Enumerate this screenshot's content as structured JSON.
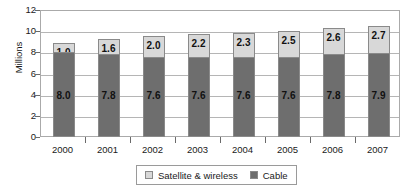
{
  "chart_data": {
    "type": "bar",
    "subtype": "stacked-bar",
    "title": "",
    "xlabel": "",
    "ylabel": "Millions",
    "ylim": [
      0,
      12
    ],
    "yticks": [
      0,
      2,
      4,
      6,
      8,
      10,
      12
    ],
    "grid": true,
    "legend_position": "bottom",
    "categories": [
      "2000",
      "2001",
      "2002",
      "2003",
      "2004",
      "2005",
      "2006",
      "2007"
    ],
    "series": [
      {
        "name": "Cable",
        "color": "#6e6e6e",
        "stack_order": 0,
        "values": [
          8.0,
          7.8,
          7.6,
          7.6,
          7.6,
          7.6,
          7.8,
          7.9
        ],
        "labels": [
          "8.0",
          "7.8",
          "7.6",
          "7.6",
          "7.6",
          "7.6",
          "7.8",
          "7.9"
        ]
      },
      {
        "name": "Satellite & wireless",
        "color": "#d8d8d8",
        "stack_order": 1,
        "values": [
          1.0,
          1.6,
          2.0,
          2.2,
          2.3,
          2.5,
          2.6,
          2.7
        ],
        "labels": [
          "1.0",
          "1.6",
          "2.0",
          "2.2",
          "2.3",
          "2.5",
          "2.6",
          "2.7"
        ]
      }
    ],
    "totals": [
      9.0,
      9.4,
      9.6,
      9.8,
      9.9,
      10.1,
      10.4,
      10.6
    ]
  },
  "legend": {
    "items": [
      {
        "label": "Satellite & wireless",
        "color": "#d8d8d8"
      },
      {
        "label": "Cable",
        "color": "#6e6e6e"
      }
    ]
  }
}
